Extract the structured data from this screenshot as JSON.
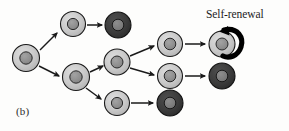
{
  "figure": {
    "panel_label": "(b)",
    "annotation": "Self-renewal",
    "width": 289,
    "height": 131,
    "background_color": "#fdfdfc"
  },
  "palette": {
    "light_cell_outer": "#c9c9c9",
    "light_cell_inner": "#8f8f8f",
    "dark_cell_outer": "#3d3d3d",
    "dark_cell_inner": "#7d7d7d",
    "outline": "#1a1a1a",
    "arrow": "#1a1a1a",
    "loop_arrow": "#000000",
    "text": "#1c1c1c"
  },
  "diagram": {
    "type": "cell-lineage-tree",
    "cells": [
      {
        "id": "stem-root",
        "label": "stem cell",
        "kind": "light",
        "cx": 26,
        "cy": 58,
        "r": 13.5
      },
      {
        "id": "progenitor-upper",
        "label": "progenitor cell upper",
        "kind": "light",
        "cx": 73,
        "cy": 24,
        "r": 12.5
      },
      {
        "id": "differentiated-1",
        "label": "differentiated cell upper",
        "kind": "dark",
        "cx": 118,
        "cy": 25,
        "r": 13.0
      },
      {
        "id": "progenitor-mid",
        "label": "progenitor cell middle",
        "kind": "light",
        "cx": 76,
        "cy": 77,
        "r": 13.5
      },
      {
        "id": "progenitor-mid2",
        "label": "progenitor cell middle 2",
        "kind": "light",
        "cx": 117,
        "cy": 62,
        "r": 13.0
      },
      {
        "id": "progenitor-low",
        "label": "progenitor cell lower",
        "kind": "light",
        "cx": 117,
        "cy": 103,
        "r": 12.5
      },
      {
        "id": "differentiated-2",
        "label": "differentiated cell lower",
        "kind": "dark",
        "cx": 170,
        "cy": 103,
        "r": 13.0
      },
      {
        "id": "branch-upper",
        "label": "branch cell upper",
        "kind": "light",
        "cx": 170,
        "cy": 44,
        "r": 12.5
      },
      {
        "id": "branch-lower",
        "label": "branch cell lower",
        "kind": "light",
        "cx": 170,
        "cy": 76,
        "r": 12.5
      },
      {
        "id": "terminal-stem",
        "label": "self-renewing stem cell",
        "kind": "light",
        "cx": 222,
        "cy": 44,
        "r": 13.0
      },
      {
        "id": "differentiated-3",
        "label": "differentiated cell right",
        "kind": "dark",
        "cx": 222,
        "cy": 76,
        "r": 13.0
      }
    ],
    "arrows": [
      {
        "id": "arrow-root-to-upper",
        "from": "stem-root",
        "to": "progenitor-upper"
      },
      {
        "id": "arrow-root-to-mid",
        "from": "stem-root",
        "to": "progenitor-mid"
      },
      {
        "id": "arrow-upper-to-diff1",
        "from": "progenitor-upper",
        "to": "differentiated-1"
      },
      {
        "id": "arrow-mid-to-mid2",
        "from": "progenitor-mid",
        "to": "progenitor-mid2"
      },
      {
        "id": "arrow-mid-to-low",
        "from": "progenitor-mid",
        "to": "progenitor-low"
      },
      {
        "id": "arrow-mid2-to-bupper",
        "from": "progenitor-mid2",
        "to": "branch-upper"
      },
      {
        "id": "arrow-mid2-to-blower",
        "from": "progenitor-mid2",
        "to": "branch-lower"
      },
      {
        "id": "arrow-bupper-to-terminal",
        "from": "branch-upper",
        "to": "terminal-stem"
      },
      {
        "id": "arrow-blower-to-diff3",
        "from": "branch-lower",
        "to": "differentiated-3"
      },
      {
        "id": "arrow-low-to-diff2",
        "from": "progenitor-low",
        "to": "differentiated-2"
      }
    ],
    "self_renewal_loop": {
      "id": "self-renewal-loop",
      "attached_to": "terminal-stem",
      "label": "Self-renewal"
    }
  }
}
